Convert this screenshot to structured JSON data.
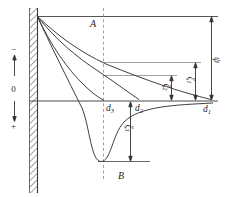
{
  "figure": {
    "background_color": "#ffffff",
    "line_color": "#3f3f3f",
    "thin_line_color": "#8c8c8c",
    "labels": {
      "plane_top": "A",
      "plane_bottom": "B",
      "axis_negative": "−",
      "axis_zero": "0",
      "axis_positive": "+",
      "surface_potential": {
        "base": "ψ",
        "sub": ""
      },
      "zeta1": {
        "base": "ζ",
        "sub": "1"
      },
      "zeta2": {
        "base": "ζ",
        "sub": "2"
      },
      "zeta3": {
        "base": "ζ",
        "sub": "3"
      },
      "d1": {
        "base": "d",
        "sub": "1"
      },
      "d2": {
        "base": "d",
        "sub": "2"
      },
      "d3": {
        "base": "d",
        "sub": "3"
      }
    },
    "elements": {
      "wall": "hatched charged surface at left",
      "dashed_line": "slipping plane through A and B",
      "curves": [
        "curve 1: slowest potential decay, reaches zero at d1, value zeta1 at slipping plane",
        "curve 2: faster decay, reaches zero at d2, value zeta2 at slipping plane",
        "curve 3: decay reaching zero at d3 on the slipping plane (zeta = 0)",
        "curve 4: charge reversal curve, minimum of opposite sign below zero near B, magnitude zeta3"
      ],
      "dimension_arrows": [
        "psi: total potential drop from surface line to zero axis",
        "zeta1: from curve-1 slipping-plane level to zero axis",
        "zeta2: from curve-2 slipping-plane level to zero axis",
        "zeta3: from zero axis down to reversed-charge minimum level"
      ]
    }
  }
}
